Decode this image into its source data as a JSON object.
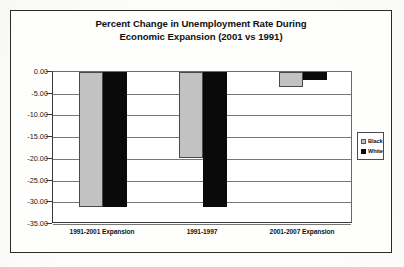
{
  "chart_data": {
    "type": "bar",
    "title_line1": "Percent Change in Unemployment Rate During",
    "title_line2": "Economic Expansion (2001 vs 1991)",
    "title": "Percent Change in Unemployment Rate During Economic Expansion (2001 vs 1991)",
    "xlabel": "",
    "ylabel": "",
    "categories": [
      "1991-2001 Expansion",
      "1991-1997",
      "2001-2007 Expansion"
    ],
    "series": [
      {
        "name": "Black",
        "color": "#c2c2c2",
        "values": [
          -31.2,
          -19.7,
          -3.5
        ]
      },
      {
        "name": "White",
        "color": "#0a0a0a",
        "values": [
          -31.0,
          -31.0,
          -1.8
        ]
      }
    ],
    "ylim": [
      -35.0,
      0.0
    ],
    "ytick_step": 5.0,
    "ytick_labels": [
      "0.00",
      "-5.00",
      "-10.00",
      "-15.00",
      "-20.00",
      "-25.00",
      "-30.00",
      "-35.00"
    ],
    "ytick_values": [
      0.0,
      -5.0,
      -10.0,
      -15.0,
      -20.0,
      -25.0,
      -30.0,
      -35.0
    ],
    "grid": true,
    "legend_position": "right",
    "legend_entries": [
      "Black",
      "White"
    ]
  }
}
